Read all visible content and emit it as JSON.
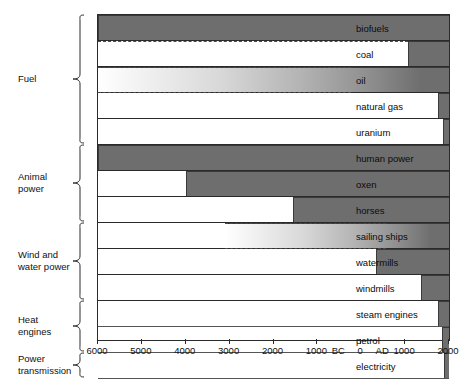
{
  "chart_data": {
    "type": "bar",
    "orientation": "horizontal-timeline",
    "xlabel": "",
    "ylabel": "",
    "xlim": [
      -6000,
      2000
    ],
    "grid": false,
    "legend": "none",
    "xtick_values": [
      -6000,
      -5000,
      -4000,
      -3000,
      -2000,
      -1000,
      0,
      1000,
      2000
    ],
    "xtick_labels": [
      "6000",
      "5000",
      "4000",
      "3000",
      "2000",
      "1000",
      "0",
      "1000",
      "2000"
    ],
    "era_markers": [
      {
        "label": "BC",
        "value": -500
      },
      {
        "label": "AD",
        "value": 500
      }
    ],
    "groups": [
      {
        "name": "Fuel",
        "label": "Fuel",
        "items": [
          {
            "label": "biofuels",
            "start": -6000,
            "end": 2000,
            "fill": "solid",
            "uncertain_start": false
          },
          {
            "label": "coal",
            "start": 1065,
            "end": 2000,
            "fill": "solid",
            "uncertain_start": false,
            "dashed_leader_from": -6000
          },
          {
            "label": "oil",
            "start": -6000,
            "end": 2000,
            "fill": "gradient",
            "uncertain_start": true
          },
          {
            "label": "natural gas",
            "start": 1750,
            "end": 2000,
            "fill": "solid",
            "uncertain_start": false
          },
          {
            "label": "uranium",
            "start": 1860,
            "end": 2000,
            "fill": "solid",
            "uncertain_start": false
          }
        ]
      },
      {
        "name": "Animal power",
        "label": "Animal\npower",
        "items": [
          {
            "label": "human power",
            "start": -6000,
            "end": 2000,
            "fill": "solid",
            "uncertain_start": false
          },
          {
            "label": "oxen",
            "start": -4000,
            "end": 2000,
            "fill": "solid",
            "uncertain_start": false
          },
          {
            "label": "horses",
            "start": -1550,
            "end": 2000,
            "fill": "solid",
            "uncertain_start": false
          }
        ]
      },
      {
        "name": "Wind and water power",
        "label": "Wind and\nwater power",
        "items": [
          {
            "label": "sailing ships",
            "start": -3100,
            "end": 2000,
            "fill": "gradient",
            "uncertain_start": true
          },
          {
            "label": "watermills",
            "start": 330,
            "end": 2000,
            "fill": "solid",
            "uncertain_start": false
          },
          {
            "label": "windmills",
            "start": 1360,
            "end": 2000,
            "fill": "solid",
            "uncertain_start": false
          }
        ]
      },
      {
        "name": "Heat engines",
        "label": "Heat\nengines",
        "items": [
          {
            "label": "steam engines",
            "start": 1750,
            "end": 2000,
            "fill": "solid",
            "uncertain_start": false
          },
          {
            "label": "petrol",
            "start": 1845,
            "end": 2000,
            "fill": "solid",
            "uncertain_start": false
          }
        ]
      },
      {
        "name": "Power transmission",
        "label": "Power\ntransmission",
        "items": [
          {
            "label": "electricity",
            "start": 1890,
            "end": 2000,
            "fill": "solid",
            "uncertain_start": false
          }
        ]
      }
    ],
    "colors": {
      "bar_fill": "#6e6e6e",
      "bar_border": "#3a3a3a",
      "frame": "#2a2a2a",
      "background": "#ffffff",
      "text": "#111111"
    }
  }
}
